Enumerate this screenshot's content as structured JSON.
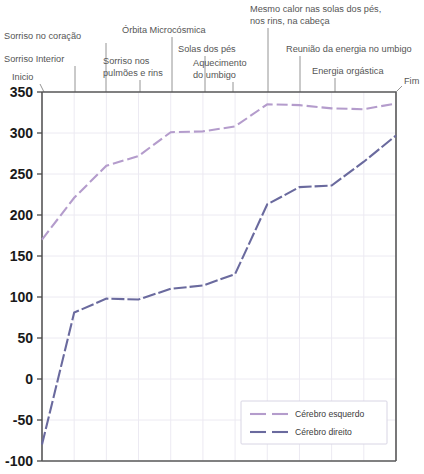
{
  "chart_data": {
    "type": "line",
    "title": "",
    "subtitle": "",
    "xlabel": "",
    "ylabel": "",
    "ylim": [
      -100,
      350
    ],
    "xlim": [
      0,
      11
    ],
    "grid": true,
    "legend_position": "bottom-right",
    "y_ticks": [
      "350",
      "300",
      "250",
      "200",
      "150",
      "100",
      "50",
      "0",
      "-50",
      "-100"
    ],
    "y_tick_values": [
      350,
      300,
      250,
      200,
      150,
      100,
      50,
      0,
      -50,
      -100
    ],
    "x": [
      0,
      1,
      2,
      3,
      4,
      5,
      6,
      7,
      8,
      9,
      10,
      11
    ],
    "stage_labels": [
      "Inicio",
      "Sorriso Interior",
      "Sorriso no coração",
      "Sorriso nos pulmões e rins",
      "Órbita Microcósmica",
      "Solas dos pés",
      "Aquecimento do umbigo",
      "Mesmo calor nas solas dos pés, nos rins, na cabeça",
      "Reunião da energia no umbigo",
      "Energia orgástica",
      "Fim"
    ],
    "series": [
      {
        "name": "Cérebro esquerdo",
        "color": "#b49ccc",
        "values": [
          170,
          221,
          260,
          272,
          301,
          302,
          308,
          335,
          334,
          330,
          329,
          336
        ]
      },
      {
        "name": "Cérebro direito",
        "color": "#6a6a9e",
        "values": [
          -80,
          81,
          98,
          97,
          110,
          114,
          128,
          213,
          234,
          236,
          265,
          297
        ]
      }
    ]
  },
  "annotations": [
    {
      "text_lines": [
        "Inicio"
      ],
      "x": 12,
      "y": 80,
      "anchor": "start",
      "lead_from_x": 40,
      "lead_from_y": 84,
      "lead_to_x": 44,
      "lead_to_y": 92
    },
    {
      "text_lines": [
        "Sorriso Interior"
      ],
      "x": 4,
      "y": 62,
      "anchor": "start",
      "lead_from_x": 75,
      "lead_from_y": 66,
      "lead_to_x": 75,
      "lead_to_y": 92
    },
    {
      "text_lines": [
        "Sorriso no coração"
      ],
      "x": 4,
      "y": 39,
      "anchor": "start",
      "lead_from_x": 106,
      "lead_from_y": 43,
      "lead_to_x": 106,
      "lead_to_y": 92
    },
    {
      "text_lines": [
        "Sorriso nos",
        "pulmões e rins"
      ],
      "x": 103,
      "y": 64,
      "anchor": "start",
      "lead_from_x": 140,
      "lead_from_y": 80,
      "lead_to_x": 140,
      "lead_to_y": 92
    },
    {
      "text_lines": [
        "Órbita Microcósmica"
      ],
      "x": 122,
      "y": 33,
      "anchor": "start",
      "lead_from_x": 172,
      "lead_from_y": 37,
      "lead_to_x": 172,
      "lead_to_y": 92
    },
    {
      "text_lines": [
        "Solas dos pés"
      ],
      "x": 178,
      "y": 52,
      "anchor": "start",
      "lead_from_x": 205,
      "lead_from_y": 56,
      "lead_to_x": 205,
      "lead_to_y": 92
    },
    {
      "text_lines": [
        "Aquecimento",
        "do umbigo"
      ],
      "x": 193,
      "y": 66,
      "anchor": "start",
      "lead_from_x": 233,
      "lead_from_y": 82,
      "lead_to_x": 233,
      "lead_to_y": 92
    },
    {
      "text_lines": [
        "Mesmo calor nas solas dos pés,",
        "nos rins, na cabeça"
      ],
      "x": 250,
      "y": 12,
      "anchor": "start",
      "lead_from_x": 268,
      "lead_from_y": 28,
      "lead_to_x": 268,
      "lead_to_y": 92
    },
    {
      "text_lines": [
        "Reunião da energia no umbigo"
      ],
      "x": 286,
      "y": 52,
      "anchor": "start",
      "lead_from_x": 300,
      "lead_from_y": 56,
      "lead_to_x": 300,
      "lead_to_y": 92
    },
    {
      "text_lines": [
        "Energia orgástica"
      ],
      "x": 312,
      "y": 74,
      "anchor": "start",
      "lead_from_x": 335,
      "lead_from_y": 78,
      "lead_to_x": 335,
      "lead_to_y": 92
    },
    {
      "text_lines": [
        "Fim"
      ],
      "x": 404,
      "y": 84,
      "anchor": "start",
      "lead_from_x": 402,
      "lead_from_y": 86,
      "lead_to_x": 396,
      "lead_to_y": 92
    }
  ],
  "legend": {
    "items": [
      {
        "label": "Cérebro esquerdo",
        "color": "#b49ccc"
      },
      {
        "label": "Cérebro direito",
        "color": "#6a6a9e"
      }
    ]
  },
  "plot_geometry": {
    "left": 42,
    "right": 396,
    "top": 92,
    "bottom": 461
  }
}
